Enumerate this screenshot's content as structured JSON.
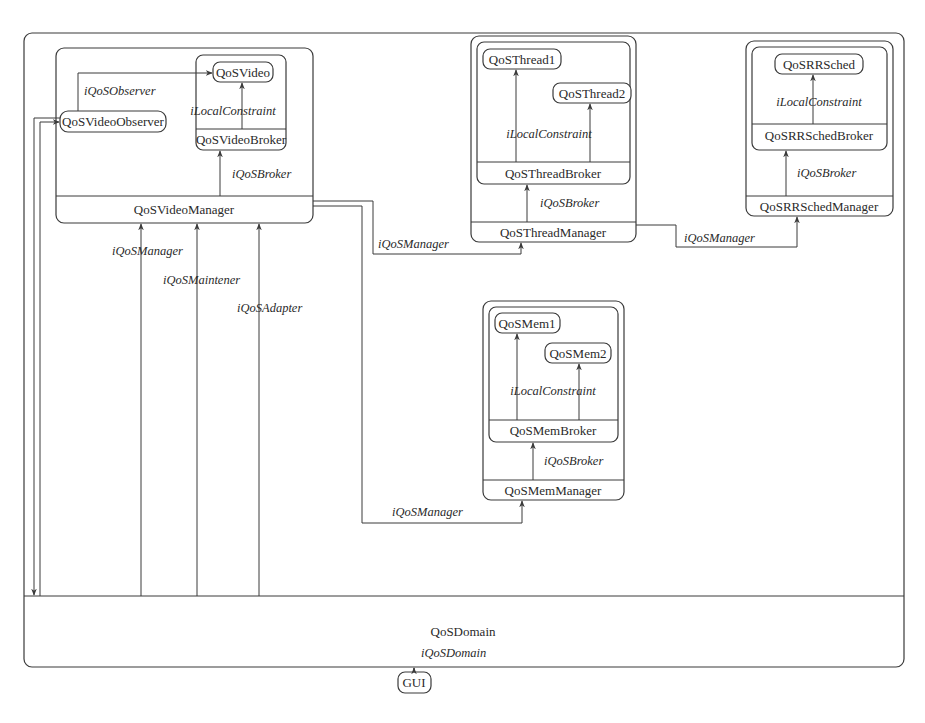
{
  "diagram": {
    "domain": {
      "name": "QoSDomain"
    },
    "gui": {
      "name": "GUI",
      "interface": "iQoSDomain"
    },
    "video_manager": {
      "name": "QoSVideoManager",
      "observer": "QoSVideoObserver",
      "observer_interface": "iQoSObserver",
      "broker": "QoSVideoBroker",
      "broker_interface": "iQoSBroker",
      "resource": "QoSVideo",
      "constraint_interface": "iLocalConstraint",
      "domain_links": [
        "iQoSManager",
        "iQoSMaintener",
        "iQoSAdapter"
      ]
    },
    "thread_manager": {
      "name": "QoSThreadManager",
      "link_interface": "iQoSManager",
      "broker": "QoSThreadBroker",
      "broker_interface": "iQoSBroker",
      "resources": [
        "QoSThread1",
        "QoSThread2"
      ],
      "constraint_interface": "iLocalConstraint"
    },
    "rrsched_manager": {
      "name": "QoSRRSchedManager",
      "link_interface": "iQoSManager",
      "broker": "QoSRRSchedBroker",
      "broker_interface": "iQoSBroker",
      "resource": "QoSRRSched",
      "constraint_interface": "iLocalConstraint"
    },
    "mem_manager": {
      "name": "QoSMemManager",
      "link_interface": "iQoSManager",
      "broker": "QoSMemBroker",
      "broker_interface": "iQoSBroker",
      "resources": [
        "QoSMem1",
        "QoSMem2"
      ],
      "constraint_interface": "iLocalConstraint"
    }
  }
}
